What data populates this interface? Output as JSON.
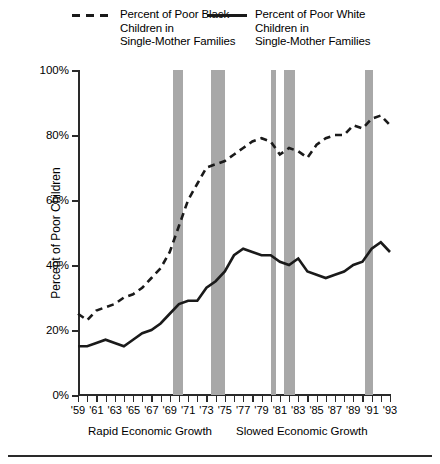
{
  "legend": {
    "black_series_label": "Percent of Poor Black\nChildren in\nSingle-Mother Families",
    "white_series_label": "Percent of Poor White\nChildren in\nSingle-Mother Families"
  },
  "axes": {
    "ylabel": "Percent of Poor Children",
    "yticks": [
      "0%",
      "20%",
      "40%",
      "60%",
      "80%",
      "100%"
    ],
    "xticks": [
      "'59",
      "'61",
      "'63",
      "'65",
      "'67",
      "'69",
      "'71",
      "'73",
      "'75",
      "'77",
      "'79",
      "'81",
      "'83",
      "'85",
      "'87",
      "'89",
      "'91",
      "'93"
    ]
  },
  "annotations": {
    "rapid_growth": "Rapid Economic Growth",
    "slowed_growth": "Slowed Economic Growth"
  },
  "colors": {
    "line": "#1a1a1a",
    "recession_bar": "#a8a8a8",
    "axis": "#2a2a2a",
    "background": "#ffffff"
  },
  "chart_data": {
    "type": "line",
    "title": "",
    "xlabel": "",
    "ylabel": "Percent of Poor Children",
    "xlim": [
      1959,
      1993
    ],
    "ylim": [
      0,
      100
    ],
    "grid": false,
    "legend_position": "top",
    "x": [
      1959,
      1960,
      1961,
      1962,
      1963,
      1964,
      1965,
      1966,
      1967,
      1968,
      1969,
      1970,
      1971,
      1972,
      1973,
      1974,
      1975,
      1976,
      1977,
      1978,
      1979,
      1980,
      1981,
      1982,
      1983,
      1984,
      1985,
      1986,
      1987,
      1988,
      1989,
      1990,
      1991,
      1992,
      1993
    ],
    "series": [
      {
        "name": "Percent of Poor Black Children in Single-Mother Families",
        "style": "dashed",
        "values": [
          25,
          23,
          26,
          27,
          28,
          30,
          31,
          33,
          36,
          39,
          44,
          52,
          60,
          65,
          70,
          71,
          72,
          74,
          76,
          78,
          79,
          78,
          74,
          76,
          75,
          73,
          77,
          79,
          80,
          80,
          83,
          82,
          85,
          86,
          83
        ]
      },
      {
        "name": "Percent of Poor White Children in Single-Mother Families",
        "style": "solid",
        "values": [
          15,
          15,
          16,
          17,
          16,
          15,
          17,
          19,
          20,
          22,
          25,
          28,
          29,
          29,
          33,
          35,
          38,
          43,
          45,
          44,
          43,
          43,
          41,
          40,
          42,
          38,
          37,
          36,
          37,
          38,
          40,
          41,
          45,
          47,
          44
        ]
      }
    ],
    "recession_bands": [
      {
        "start": 1969.4,
        "end": 1970.4
      },
      {
        "start": 1973.5,
        "end": 1975.0
      },
      {
        "start": 1980.0,
        "end": 1980.6
      },
      {
        "start": 1981.4,
        "end": 1982.6
      },
      {
        "start": 1990.3,
        "end": 1991.1
      }
    ],
    "era_annotations": [
      {
        "label": "Rapid Economic Growth",
        "range": [
          1959,
          1973
        ]
      },
      {
        "label": "Slowed Economic Growth",
        "range": [
          1973,
          1993
        ]
      }
    ]
  }
}
